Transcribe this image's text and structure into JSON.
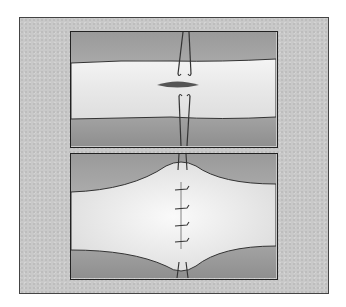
{
  "figure": {
    "title": "",
    "panels": [
      {
        "id": "top",
        "description": "Tubular tissue with elliptical incision and two stay sutures above and below the incision"
      },
      {
        "id": "bottom",
        "description": "Incision closed transversely with interrupted sutures, tissue bulging at closure site"
      }
    ],
    "colors": {
      "background": "#c9c9c9",
      "tissue": "#efefef",
      "shadow": "#8a8a8a",
      "line": "#222222",
      "incision": "#444444"
    }
  }
}
